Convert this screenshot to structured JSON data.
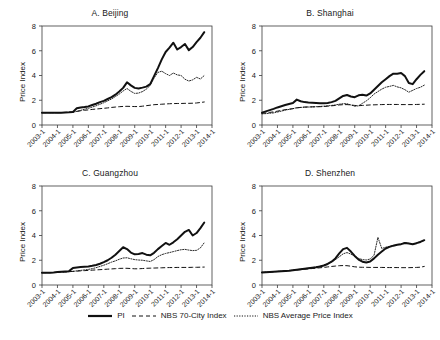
{
  "figure": {
    "y_axis_label": "Price Index",
    "y_ticks": [
      0,
      2,
      4,
      6,
      8
    ],
    "ylim": [
      0,
      8
    ],
    "x_ticks": [
      "2003-1",
      "2004-1",
      "2005-1",
      "2006-1",
      "2007-1",
      "2008-1",
      "2009-1",
      "2010-1",
      "2011-1",
      "2012-1",
      "2013-1",
      "2014-1"
    ],
    "xlim": [
      2003.0,
      2014.0
    ]
  },
  "legend": {
    "position": "bottom-center",
    "entries": [
      {
        "label": "PI",
        "style": "solid",
        "name": "legend-pi"
      },
      {
        "label": "NBS 70-City Index",
        "style": "dashed",
        "name": "legend-nbs-70-city"
      },
      {
        "label": "NBS Average Price Index",
        "style": "dotted",
        "name": "legend-nbs-average-price"
      }
    ]
  },
  "colors": {
    "line": "#111111",
    "axis": "#3a3a3a",
    "text": "#1a1a1a",
    "background": "#ffffff"
  },
  "chart_data": {
    "type": "line",
    "title": "",
    "xlabel": "",
    "ylabel": "Price Index",
    "ylim": [
      0,
      8
    ],
    "xlim": [
      2003.0,
      2014.0
    ],
    "grid": false,
    "legend_position": "bottom-center",
    "tick_labels": {
      "x": [
        "2003-1",
        "2004-1",
        "2005-1",
        "2006-1",
        "2007-1",
        "2008-1",
        "2009-1",
        "2010-1",
        "2011-1",
        "2012-1",
        "2013-1",
        "2014-1"
      ],
      "y": [
        "0",
        "2",
        "4",
        "6",
        "8"
      ]
    },
    "x": [
      2003.0,
      2003.25,
      2003.5,
      2003.75,
      2004.0,
      2004.25,
      2004.5,
      2004.75,
      2005.0,
      2005.25,
      2005.5,
      2005.75,
      2006.0,
      2006.25,
      2006.5,
      2006.75,
      2007.0,
      2007.25,
      2007.5,
      2007.75,
      2008.0,
      2008.25,
      2008.5,
      2008.75,
      2009.0,
      2009.25,
      2009.5,
      2009.75,
      2010.0,
      2010.25,
      2010.5,
      2010.75,
      2011.0,
      2011.25,
      2011.5,
      2011.75,
      2012.0,
      2012.25,
      2012.5,
      2012.75,
      2013.0,
      2013.25,
      2013.5
    ],
    "panels": [
      {
        "id": "beijing",
        "title": "A. Beijing",
        "series": [
          {
            "name": "PI",
            "style": "solid",
            "values": [
              1.0,
              1.0,
              1.0,
              1.0,
              1.0,
              1.0,
              1.02,
              1.03,
              1.05,
              1.35,
              1.42,
              1.45,
              1.5,
              1.62,
              1.72,
              1.85,
              1.95,
              2.1,
              2.25,
              2.45,
              2.7,
              3.0,
              3.45,
              3.2,
              3.0,
              2.95,
              3.02,
              3.1,
              3.3,
              3.95,
              4.6,
              5.3,
              5.9,
              6.25,
              6.65,
              6.1,
              6.3,
              6.55,
              6.05,
              6.3,
              6.7,
              7.05,
              7.5
            ]
          },
          {
            "name": "NBS 70-City Index",
            "style": "dashed",
            "values": [
              1.0,
              1.0,
              1.0,
              1.0,
              1.0,
              1.0,
              1.02,
              1.04,
              1.06,
              1.1,
              1.15,
              1.19,
              1.22,
              1.26,
              1.29,
              1.32,
              1.35,
              1.38,
              1.42,
              1.45,
              1.48,
              1.5,
              1.51,
              1.5,
              1.49,
              1.49,
              1.52,
              1.56,
              1.6,
              1.64,
              1.66,
              1.68,
              1.7,
              1.72,
              1.73,
              1.74,
              1.74,
              1.75,
              1.75,
              1.76,
              1.78,
              1.82,
              1.86
            ]
          },
          {
            "name": "NBS Average Price Index",
            "style": "dotted",
            "values": [
              1.0,
              1.0,
              1.0,
              1.0,
              1.0,
              1.0,
              1.01,
              1.02,
              1.03,
              1.1,
              1.18,
              1.28,
              1.35,
              1.45,
              1.55,
              1.68,
              1.8,
              1.95,
              2.1,
              2.3,
              2.5,
              2.75,
              2.95,
              2.72,
              2.55,
              2.58,
              2.7,
              2.9,
              3.2,
              3.8,
              4.25,
              4.35,
              4.15,
              4.0,
              4.2,
              4.05,
              4.0,
              3.7,
              3.55,
              3.65,
              3.85,
              3.72,
              4.0
            ]
          }
        ]
      },
      {
        "id": "shanghai",
        "title": "B. Shanghai",
        "series": [
          {
            "name": "PI",
            "style": "solid",
            "values": [
              1.0,
              1.1,
              1.2,
              1.3,
              1.42,
              1.52,
              1.62,
              1.7,
              1.78,
              2.05,
              1.92,
              1.85,
              1.82,
              1.8,
              1.78,
              1.76,
              1.75,
              1.78,
              1.85,
              1.95,
              2.15,
              2.35,
              2.42,
              2.3,
              2.25,
              2.4,
              2.45,
              2.38,
              2.55,
              2.85,
              3.15,
              3.45,
              3.7,
              3.95,
              4.15,
              4.15,
              4.2,
              3.95,
              3.4,
              3.3,
              3.7,
              4.05,
              4.35
            ]
          },
          {
            "name": "NBS 70-City Index",
            "style": "dashed",
            "values": [
              0.95,
              0.98,
              1.02,
              1.06,
              1.12,
              1.18,
              1.24,
              1.28,
              1.32,
              1.38,
              1.42,
              1.45,
              1.46,
              1.47,
              1.47,
              1.48,
              1.49,
              1.52,
              1.55,
              1.58,
              1.62,
              1.64,
              1.65,
              1.62,
              1.58,
              1.56,
              1.58,
              1.6,
              1.62,
              1.63,
              1.64,
              1.65,
              1.66,
              1.66,
              1.66,
              1.66,
              1.65,
              1.65,
              1.65,
              1.65,
              1.66,
              1.67,
              1.68
            ]
          },
          {
            "name": "NBS Average Price Index",
            "style": "dotted",
            "values": [
              0.9,
              0.92,
              0.95,
              0.98,
              1.05,
              1.12,
              1.2,
              1.26,
              1.32,
              1.4,
              1.42,
              1.44,
              1.45,
              1.46,
              1.48,
              1.5,
              1.52,
              1.55,
              1.58,
              1.62,
              1.68,
              1.72,
              1.72,
              1.62,
              1.52,
              1.55,
              1.75,
              1.95,
              2.2,
              2.5,
              2.7,
              2.9,
              3.05,
              3.12,
              3.2,
              3.08,
              3.0,
              2.85,
              2.65,
              2.8,
              2.95,
              3.05,
              3.22
            ]
          }
        ]
      },
      {
        "id": "guangzhou",
        "title": "C. Guangzhou",
        "series": [
          {
            "name": "PI",
            "style": "solid",
            "values": [
              1.0,
              1.0,
              1.0,
              1.02,
              1.05,
              1.08,
              1.1,
              1.12,
              1.38,
              1.42,
              1.45,
              1.48,
              1.5,
              1.55,
              1.62,
              1.72,
              1.85,
              2.0,
              2.2,
              2.45,
              2.75,
              3.05,
              2.9,
              2.62,
              2.48,
              2.5,
              2.58,
              2.45,
              2.4,
              2.6,
              2.9,
              3.15,
              3.4,
              3.25,
              3.45,
              3.7,
              4.0,
              4.3,
              4.45,
              4.0,
              4.2,
              4.6,
              5.05
            ]
          },
          {
            "name": "NBS 70-City Index",
            "style": "dashed",
            "values": [
              1.0,
              1.0,
              1.0,
              1.01,
              1.02,
              1.04,
              1.06,
              1.08,
              1.1,
              1.12,
              1.14,
              1.16,
              1.18,
              1.2,
              1.22,
              1.24,
              1.26,
              1.28,
              1.3,
              1.32,
              1.34,
              1.35,
              1.35,
              1.33,
              1.31,
              1.31,
              1.33,
              1.35,
              1.36,
              1.37,
              1.38,
              1.39,
              1.4,
              1.41,
              1.41,
              1.42,
              1.42,
              1.42,
              1.42,
              1.43,
              1.43,
              1.44,
              1.45
            ]
          },
          {
            "name": "NBS Average Price Index",
            "style": "dotted",
            "values": [
              1.0,
              1.0,
              1.0,
              1.01,
              1.03,
              1.05,
              1.06,
              1.08,
              1.1,
              1.14,
              1.18,
              1.22,
              1.26,
              1.32,
              1.4,
              1.5,
              1.6,
              1.72,
              1.85,
              1.95,
              2.08,
              2.18,
              2.2,
              2.12,
              2.05,
              2.02,
              2.0,
              1.95,
              1.9,
              2.05,
              2.3,
              2.45,
              2.55,
              2.62,
              2.7,
              2.78,
              2.85,
              2.88,
              2.82,
              2.78,
              2.8,
              3.0,
              3.42
            ]
          }
        ]
      },
      {
        "id": "shenzhen",
        "title": "D. Shenzhen",
        "series": [
          {
            "name": "PI",
            "style": "solid",
            "values": [
              1.02,
              1.04,
              1.06,
              1.08,
              1.1,
              1.12,
              1.14,
              1.16,
              1.2,
              1.24,
              1.28,
              1.32,
              1.36,
              1.4,
              1.44,
              1.5,
              1.58,
              1.7,
              1.88,
              2.15,
              2.55,
              2.9,
              3.0,
              2.7,
              2.35,
              2.05,
              1.88,
              1.82,
              1.9,
              2.15,
              2.45,
              2.7,
              2.95,
              3.08,
              3.18,
              3.25,
              3.3,
              3.4,
              3.35,
              3.3,
              3.38,
              3.48,
              3.62
            ]
          },
          {
            "name": "NBS 70-City Index",
            "style": "dashed",
            "values": [
              1.02,
              1.03,
              1.05,
              1.07,
              1.09,
              1.11,
              1.13,
              1.15,
              1.18,
              1.21,
              1.24,
              1.27,
              1.3,
              1.33,
              1.36,
              1.39,
              1.42,
              1.46,
              1.5,
              1.53,
              1.56,
              1.57,
              1.56,
              1.52,
              1.47,
              1.44,
              1.43,
              1.43,
              1.42,
              1.42,
              1.42,
              1.42,
              1.41,
              1.41,
              1.41,
              1.41,
              1.4,
              1.4,
              1.4,
              1.41,
              1.42,
              1.44,
              1.5
            ]
          },
          {
            "name": "NBS Average Price Index",
            "style": "dotted",
            "values": [
              1.02,
              1.04,
              1.06,
              1.08,
              1.1,
              1.12,
              1.14,
              1.16,
              1.2,
              1.24,
              1.28,
              1.32,
              1.36,
              1.4,
              1.45,
              1.52,
              1.6,
              1.72,
              1.86,
              2.05,
              2.28,
              2.52,
              2.62,
              2.5,
              2.32,
              2.15,
              2.05,
              2.02,
              2.1,
              2.4,
              3.85,
              2.95,
              3.05,
              3.12,
              3.2,
              3.26,
              3.32,
              3.42,
              3.36,
              3.3,
              3.4,
              3.5,
              3.6
            ]
          }
        ]
      }
    ]
  }
}
